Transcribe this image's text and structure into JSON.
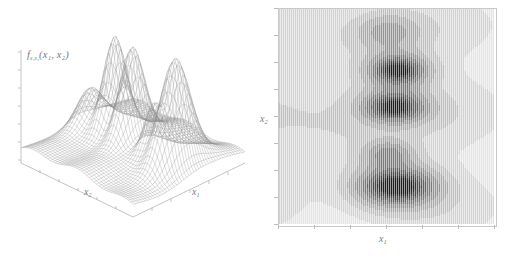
{
  "figure": {
    "background_color": "#ffffff",
    "ink_color": "#6b6b6b",
    "panels": [
      "surface-3d",
      "contour-density"
    ]
  },
  "surface_panel": {
    "name": "3d-wireframe-surface",
    "z_axis_label": "f",
    "z_axis_label_sub": "x₁x₂",
    "z_axis_label_arg": "(x₁, x₂)",
    "x1_label": "x",
    "x1_sub": "1",
    "x2_label": "x",
    "x2_sub": "2",
    "z_tick_count": 7,
    "x1_tick_count": 6,
    "x2_tick_count": 6,
    "mesh_color": "#8a8a8a",
    "mesh_rows": 46,
    "mesh_cols": 46
  },
  "contour_panel": {
    "name": "grayscale-contour-plot",
    "x1_label": "x",
    "x1_sub": "1",
    "x2_label": "x",
    "x2_sub": "2",
    "frame_color": "#c9c9c9",
    "x_tick_count": 7,
    "y_tick_count": 9,
    "shade_levels": [
      "#ffffff",
      "#f2f2f2",
      "#e4e4e4",
      "#d3d3d3",
      "#c0c0c0",
      "#ababab",
      "#949494",
      "#7c7c7c",
      "#636363",
      "#4b4b4b",
      "#343434",
      "#1f1f1f"
    ]
  },
  "chart_data": {
    "type": "heatmap",
    "title": "",
    "subtitle": "",
    "xlabel": "x₁",
    "ylabel": "x₂",
    "zlabel": "f_{x₁x₂}(x₁, x₂)",
    "xlim": [
      -3,
      3
    ],
    "ylim": [
      -3,
      3
    ],
    "zlim": [
      0,
      1
    ],
    "grid": false,
    "legend": "none",
    "modes": [
      {
        "id": "mode-1",
        "x": 0.05,
        "y": 2.35,
        "peak": 0.34,
        "sigma_x": 0.62,
        "sigma_y": 0.36
      },
      {
        "id": "mode-2",
        "x": 0.32,
        "y": 1.3,
        "peak": 0.92,
        "sigma_x": 0.56,
        "sigma_y": 0.3
      },
      {
        "id": "mode-3",
        "x": 0.22,
        "y": 0.28,
        "peak": 0.86,
        "sigma_x": 0.6,
        "sigma_y": 0.32
      },
      {
        "id": "mode-4",
        "x": 0.05,
        "y": -1.05,
        "peak": 0.45,
        "sigma_x": 0.48,
        "sigma_y": 0.26
      },
      {
        "id": "mode-5",
        "x": 0.28,
        "y": -1.95,
        "peak": 1.0,
        "sigma_x": 0.74,
        "sigma_y": 0.38
      }
    ],
    "background_ridges": [
      {
        "id": "ridge-upper",
        "y": 2.6,
        "level": 0.12
      },
      {
        "id": "ridge-mid",
        "y": 0.1,
        "level": 0.14
      },
      {
        "id": "ridge-lower",
        "y": -2.55,
        "level": 0.13
      }
    ],
    "contour_levels": [
      0.02,
      0.06,
      0.12,
      0.2,
      0.3,
      0.42,
      0.55,
      0.68,
      0.8,
      0.9,
      0.97
    ]
  }
}
